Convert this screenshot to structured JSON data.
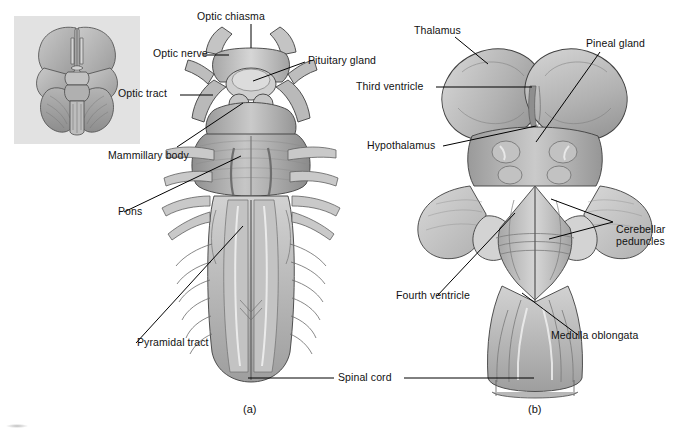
{
  "figure": {
    "panels": [
      {
        "id": "a",
        "caption": "(a)",
        "view": "anterior (ventral) view of brain stem"
      },
      {
        "id": "b",
        "caption": "(b)",
        "view": "posterior (dorsal) view of brain stem"
      }
    ],
    "shared_labels": [
      {
        "name": "spinal-cord",
        "text": "Spinal cord"
      }
    ]
  },
  "inset": {
    "name": "inferior-brain-view-inset",
    "description": "Inferior view of whole brain showing brain stem location"
  },
  "panel_a": {
    "caption": "(a)",
    "labels": [
      {
        "key": "optic_chiasma",
        "text": "Optic chiasma"
      },
      {
        "key": "optic_nerve",
        "text": "Optic nerve"
      },
      {
        "key": "optic_tract",
        "text": "Optic tract"
      },
      {
        "key": "pituitary_gland",
        "text": "Pituitary gland"
      },
      {
        "key": "mammillary_body",
        "text": "Mammillary body"
      },
      {
        "key": "pons",
        "text": "Pons"
      },
      {
        "key": "pyramidal_tract",
        "text": "Pyramidal tract"
      }
    ]
  },
  "panel_b": {
    "caption": "(b)",
    "labels": [
      {
        "key": "thalamus",
        "text": "Thalamus"
      },
      {
        "key": "pineal_gland",
        "text": "Pineal gland"
      },
      {
        "key": "third_ventricle",
        "text": "Third ventricle"
      },
      {
        "key": "hypothalamus",
        "text": "Hypothalamus"
      },
      {
        "key": "cerebellar_peduncles",
        "text": "Cerebellar peduncles"
      },
      {
        "key": "fourth_ventricle",
        "text": "Fourth ventricle"
      },
      {
        "key": "medulla_oblongata",
        "text": "Medulla oblongata"
      }
    ]
  },
  "shared": {
    "spinal_cord": "Spinal cord"
  },
  "colors": {
    "background": "#ffffff",
    "inset_background": "#e2e2e2",
    "tissue_light": "#cfcfcf",
    "tissue_mid": "#a8a8a8",
    "tissue_dark": "#7d7d7d",
    "tissue_darkest": "#5e5e5e",
    "outline": "#3c3c3c",
    "leader_line": "#000000",
    "text": "#111111"
  }
}
